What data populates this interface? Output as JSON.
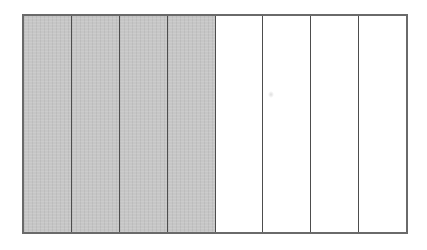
{
  "diagram": {
    "type": "fraction-bar",
    "total_parts": 8,
    "shaded_parts": 4,
    "unshaded_parts": 4,
    "fraction_shaded": "4/8",
    "orientation": "vertical-strips",
    "colors": {
      "shaded_fill": "#c6c6c6",
      "unshaded_fill": "#ffffff",
      "divider_line": "#4d4d4d",
      "outer_border": "#6a6a6a",
      "background": "#ffffff"
    },
    "segments": [
      {
        "index": 1,
        "shaded": true
      },
      {
        "index": 2,
        "shaded": true
      },
      {
        "index": 3,
        "shaded": true
      },
      {
        "index": 4,
        "shaded": true
      },
      {
        "index": 5,
        "shaded": false
      },
      {
        "index": 6,
        "shaded": false
      },
      {
        "index": 7,
        "shaded": false
      },
      {
        "index": 8,
        "shaded": false
      }
    ]
  }
}
